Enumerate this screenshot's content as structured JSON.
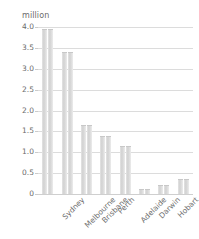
{
  "chart_data": {
    "type": "bar",
    "title": "",
    "subtitle": "",
    "unit_label": "million",
    "xlabel": "",
    "ylabel": "million",
    "categories": [
      "Sydney",
      "Melbourne",
      "Brisbane",
      "Perth",
      "Adelaide",
      "Darwin",
      "Hobart",
      "Canberra"
    ],
    "values": [
      3.95,
      3.4,
      1.65,
      1.4,
      1.15,
      0.12,
      0.22,
      0.37
    ],
    "bars_per_category": 2,
    "ylim": [
      0,
      4.0
    ],
    "ytick_labels": [
      "4.0",
      "3.5",
      "3.0",
      "2.5",
      "2.0",
      "1.5",
      "1.0",
      "0.5",
      "0"
    ],
    "ytick_values": [
      4.0,
      3.5,
      3.0,
      2.5,
      2.0,
      1.5,
      1.0,
      0.5,
      0
    ],
    "grid": true,
    "legend": false,
    "legend_position": "none",
    "bar_color": "#d8d8d8",
    "grid_color": "#dcdcdc",
    "text_color": "#6b6b6b",
    "background_color": "#ffffff"
  }
}
